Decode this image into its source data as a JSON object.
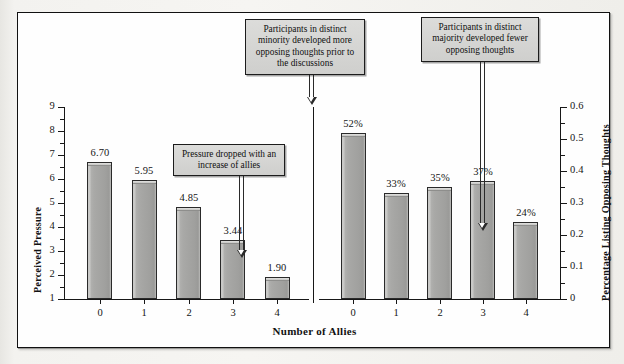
{
  "chart_data": {
    "type": "bar",
    "title": "",
    "xlabel": "Number of Allies",
    "categories": [
      "0",
      "1",
      "2",
      "3",
      "4"
    ],
    "panels": [
      {
        "name": "Perceived Pressure",
        "ylabel": "Perceived Pressure",
        "ylim": [
          1,
          9
        ],
        "ytick_labels": [
          "1",
          "2",
          "3",
          "4",
          "5",
          "6",
          "7",
          "8",
          "9"
        ],
        "values": [
          6.7,
          5.95,
          4.85,
          3.44,
          1.9
        ],
        "value_labels": [
          "6.70",
          "5.95",
          "4.85",
          "3.44",
          "1.90"
        ]
      },
      {
        "name": "Percentage Listing Opposing Thoughts",
        "ylabel": "Percentage Listing Opposing Thoughts",
        "ylim": [
          0,
          0.6
        ],
        "ytick_labels": [
          "0",
          "0.1",
          "0.2",
          "0.3",
          "0.4",
          "0.5",
          "0.6"
        ],
        "values": [
          0.52,
          0.33,
          0.35,
          0.37,
          0.24
        ],
        "value_labels": [
          "52%",
          "33%",
          "35%",
          "37%",
          "24%"
        ]
      }
    ],
    "annotations": [
      "Participants in distinct minority developed more opposing thoughts prior to the discussions",
      "Pressure dropped with an increase of allies",
      "Participants in distinct majority developed fewer opposing thoughts"
    ],
    "grid": false,
    "legend": null,
    "colors": {
      "bar_fill": "#a6a6a4",
      "bar_edge": "#2a2a2a",
      "callout_fill": "#d5d5d3",
      "axis": "#171717",
      "plot_background": "#fefefe",
      "page_background": "#f2f1ee"
    }
  },
  "axes": {
    "left_title": "Perceived Pressure",
    "right_title": "Percentage Listing Opposing Thoughts",
    "x_title": "Number of Allies",
    "left_ticks": [
      "9",
      "8",
      "7",
      "6",
      "5",
      "4",
      "3",
      "2",
      "1"
    ],
    "right_ticks": [
      "0.6",
      "0.5",
      "0.4",
      "0.3",
      "0.2",
      "0.1",
      "0"
    ],
    "x_ticks_left": [
      "0",
      "1",
      "2",
      "3",
      "4"
    ],
    "x_ticks_right": [
      "0",
      "1",
      "2",
      "3",
      "4"
    ]
  },
  "bars_left": [
    {
      "category": "0",
      "label": "6.70",
      "value": 6.7
    },
    {
      "category": "1",
      "label": "5.95",
      "value": 5.95
    },
    {
      "category": "2",
      "label": "4.85",
      "value": 4.85
    },
    {
      "category": "3",
      "label": "3.44",
      "value": 3.44
    },
    {
      "category": "4",
      "label": "1.90",
      "value": 1.9
    }
  ],
  "bars_right": [
    {
      "category": "0",
      "label": "52%",
      "value": 0.52
    },
    {
      "category": "1",
      "label": "33%",
      "value": 0.33
    },
    {
      "category": "2",
      "label": "35%",
      "value": 0.35
    },
    {
      "category": "3",
      "label": "37%",
      "value": 0.37
    },
    {
      "category": "4",
      "label": "24%",
      "value": 0.24
    }
  ],
  "callouts": {
    "minority": "Participants in distinct minority developed more opposing thoughts prior to the discussions",
    "pressure": "Pressure dropped with an increase of allies",
    "majority": "Participants in distinct majority developed fewer opposing thoughts"
  }
}
